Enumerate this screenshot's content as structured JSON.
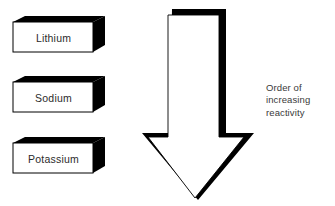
{
  "figure": {
    "background_color": "#ffffff",
    "ink_color": "#000000",
    "text_color": "#2b2b2b"
  },
  "boxes": [
    {
      "label": "Lithium",
      "order": 1
    },
    {
      "label": "Sodium",
      "order": 2
    },
    {
      "label": "Potassium",
      "order": 3
    }
  ],
  "arrow": {
    "name": "downward-arrow",
    "direction": "down",
    "fill": "#ffffff",
    "outline": "#000000"
  },
  "caption": {
    "line1": "Order of",
    "line2": "increasing",
    "line3": "reactivity"
  }
}
